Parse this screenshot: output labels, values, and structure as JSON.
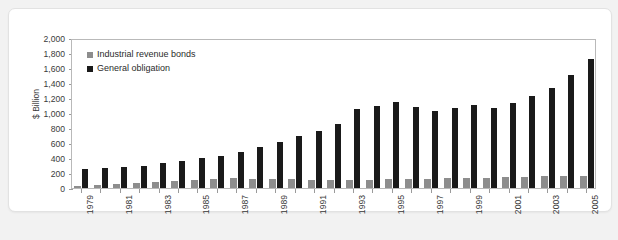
{
  "chart_data": {
    "type": "bar",
    "title": "",
    "xlabel": "",
    "ylabel": "$ Billion",
    "ylim": [
      0,
      2000
    ],
    "ytick_step": 200,
    "grid": false,
    "legend_position": "top-left",
    "x": [
      1979,
      1980,
      1981,
      1982,
      1983,
      1984,
      1985,
      1986,
      1987,
      1988,
      1989,
      1990,
      1991,
      1992,
      1993,
      1994,
      1995,
      1996,
      1997,
      1998,
      1999,
      2000,
      2001,
      2002,
      2003,
      2004,
      2005
    ],
    "categories": [
      "1979",
      "1980",
      "1981",
      "1982",
      "1983",
      "1984",
      "1985",
      "1986",
      "1987",
      "1988",
      "1989",
      "1990",
      "1991",
      "1992",
      "1993",
      "1994",
      "1995",
      "1996",
      "1997",
      "1998",
      "1999",
      "2000",
      "2001",
      "2002",
      "2003",
      "2004",
      "2005"
    ],
    "xtick_labels": [
      "1979",
      "1981",
      "1983",
      "1985",
      "1987",
      "1989",
      "1991",
      "1993",
      "1995",
      "1997",
      "1999",
      "2001",
      "2003",
      "2005"
    ],
    "ytick_labels": [
      "0",
      "200",
      "400",
      "600",
      "800",
      "1,000",
      "1,200",
      "1,400",
      "1,600",
      "1,800",
      "2,000"
    ],
    "ytick_values": [
      0,
      200,
      400,
      600,
      800,
      1000,
      1200,
      1400,
      1600,
      1800,
      2000
    ],
    "series": [
      {
        "name": "Industrial revenue bonds",
        "color": "#8d8d8d",
        "values": [
          30,
          40,
          55,
          70,
          85,
          95,
          110,
          125,
          130,
          125,
          120,
          115,
          110,
          105,
          105,
          110,
          115,
          120,
          125,
          130,
          135,
          140,
          145,
          150,
          155,
          160,
          165
        ]
      },
      {
        "name": "General obligation",
        "color": "#1a1a1a",
        "values": [
          260,
          265,
          275,
          300,
          330,
          360,
          395,
          430,
          480,
          550,
          620,
          690,
          760,
          860,
          1060,
          1100,
          1150,
          1080,
          1030,
          1070,
          1110,
          1070,
          1140,
          1230,
          1340,
          1510,
          1720
        ]
      }
    ]
  }
}
